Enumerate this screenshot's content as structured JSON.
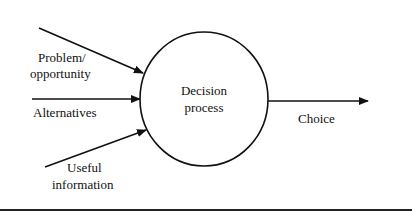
{
  "diagram": {
    "type": "flow",
    "process": {
      "line1": "Decision",
      "line2": "process"
    },
    "inputs": [
      {
        "line1": "Problem/",
        "line2": "opportunity"
      },
      {
        "line1": "Alternatives"
      },
      {
        "line1": "Useful",
        "line2": "information"
      }
    ],
    "output": {
      "line1": "Choice"
    },
    "colors": {
      "stroke": "#111111",
      "background": "#ffffff"
    }
  }
}
